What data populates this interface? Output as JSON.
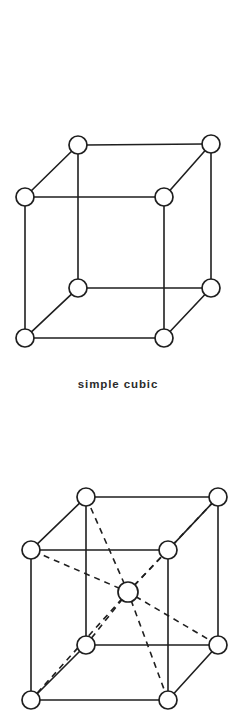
{
  "page": {
    "background_color": "#ffffff",
    "ink_color": "#1f1f1f",
    "atom_fill_color": "#ffffff",
    "width": 236,
    "height": 727
  },
  "figures": [
    {
      "id": "simple-cubic",
      "name": "simple-cubic-lattice",
      "caption": "simple  cubic",
      "lattice_type": "simple cubic",
      "atom_count": 8,
      "has_center_atom": false,
      "atom_radius": 9,
      "solid_edge_count": 12,
      "dashed_edge_count": 0,
      "atoms": [
        {
          "label": "back-top-left",
          "x": 78,
          "y": 145
        },
        {
          "label": "back-top-right",
          "x": 211,
          "y": 144
        },
        {
          "label": "front-top-left",
          "x": 25,
          "y": 197
        },
        {
          "label": "front-top-right",
          "x": 164,
          "y": 197
        },
        {
          "label": "back-bottom-left",
          "x": 78,
          "y": 288
        },
        {
          "label": "back-bottom-right",
          "x": 211,
          "y": 288
        },
        {
          "label": "front-bottom-left",
          "x": 25,
          "y": 338
        },
        {
          "label": "front-bottom-right",
          "x": 164,
          "y": 338
        }
      ],
      "solid_edges": [
        [
          0,
          1
        ],
        [
          0,
          2
        ],
        [
          0,
          4
        ],
        [
          1,
          3
        ],
        [
          1,
          5
        ],
        [
          2,
          3
        ],
        [
          2,
          6
        ],
        [
          3,
          7
        ],
        [
          4,
          5
        ],
        [
          4,
          6
        ],
        [
          5,
          7
        ],
        [
          6,
          7
        ]
      ],
      "dashed_edges": []
    },
    {
      "id": "bcc",
      "name": "body-centered-cubic-lattice",
      "caption": "",
      "lattice_type": "body-centered cubic",
      "atom_count": 9,
      "has_center_atom": true,
      "atom_radius": 9,
      "center_atom_radius": 10,
      "solid_edge_count": 12,
      "dashed_edge_count": 8,
      "atoms": [
        {
          "label": "back-top-left",
          "x": 86,
          "y": 497
        },
        {
          "label": "back-top-right",
          "x": 218,
          "y": 497
        },
        {
          "label": "front-top-left",
          "x": 31,
          "y": 550
        },
        {
          "label": "front-top-right",
          "x": 168,
          "y": 550
        },
        {
          "label": "back-bottom-left",
          "x": 86,
          "y": 645
        },
        {
          "label": "back-bottom-right",
          "x": 218,
          "y": 645
        },
        {
          "label": "front-bottom-left",
          "x": 31,
          "y": 700
        },
        {
          "label": "front-bottom-right",
          "x": 168,
          "y": 700
        },
        {
          "label": "body-center",
          "x": 128,
          "y": 592
        }
      ],
      "solid_edges": [
        [
          0,
          1
        ],
        [
          0,
          2
        ],
        [
          0,
          4
        ],
        [
          1,
          3
        ],
        [
          1,
          5
        ],
        [
          2,
          3
        ],
        [
          2,
          6
        ],
        [
          3,
          7
        ],
        [
          4,
          5
        ],
        [
          4,
          6
        ],
        [
          5,
          7
        ],
        [
          6,
          7
        ]
      ],
      "dashed_edges": [
        [
          8,
          0
        ],
        [
          8,
          1
        ],
        [
          8,
          2
        ],
        [
          8,
          3
        ],
        [
          8,
          4
        ],
        [
          8,
          5
        ],
        [
          8,
          6
        ],
        [
          8,
          7
        ]
      ]
    }
  ]
}
